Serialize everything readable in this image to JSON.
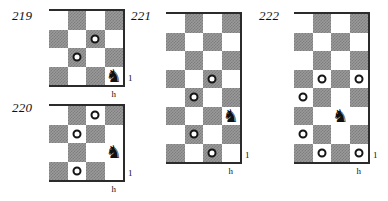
{
  "page": {
    "background_color": "#ffffff",
    "dark_square_color": "#9a9a9a",
    "light_square_color": "#ffffff",
    "ink_color": "#151515"
  },
  "diagrams": [
    {
      "id": "diagram-219",
      "number": "219",
      "columns": 4,
      "rows": 4,
      "top_left_square": "light",
      "rank_label": "1",
      "file_label": "h",
      "pieces": [
        {
          "type": "knight",
          "glyph": "♞",
          "col": 4,
          "row": 4
        }
      ],
      "markers": [
        {
          "type": "ring",
          "col": 3,
          "row": 2
        },
        {
          "type": "ring",
          "col": 2,
          "row": 3
        }
      ]
    },
    {
      "id": "diagram-220",
      "number": "220",
      "columns": 4,
      "rows": 4,
      "top_left_square": "light",
      "rank_label": "1",
      "file_label": "h",
      "pieces": [
        {
          "type": "knight",
          "glyph": "♞",
          "col": 4,
          "row": 3
        }
      ],
      "markers": [
        {
          "type": "ring",
          "col": 3,
          "row": 1
        },
        {
          "type": "ring",
          "col": 2,
          "row": 2
        },
        {
          "type": "ring",
          "col": 2,
          "row": 4
        }
      ]
    },
    {
      "id": "diagram-221",
      "number": "221",
      "columns": 4,
      "rows": 8,
      "top_left_square": "light",
      "rank_label": "1",
      "file_label": "h",
      "pieces": [
        {
          "type": "knight",
          "glyph": "♞",
          "col": 4,
          "row": 6
        }
      ],
      "markers": [
        {
          "type": "ring",
          "col": 3,
          "row": 4
        },
        {
          "type": "ring",
          "col": 2,
          "row": 5
        },
        {
          "type": "ring",
          "col": 2,
          "row": 7
        },
        {
          "type": "ring",
          "col": 3,
          "row": 8
        }
      ]
    },
    {
      "id": "diagram-222",
      "number": "222",
      "columns": 4,
      "rows": 8,
      "top_left_square": "light",
      "rank_label": "1",
      "file_label": "h",
      "pieces": [
        {
          "type": "knight",
          "glyph": "♞",
          "col": 3,
          "row": 6
        }
      ],
      "markers": [
        {
          "type": "ring",
          "col": 2,
          "row": 4
        },
        {
          "type": "ring",
          "col": 4,
          "row": 4
        },
        {
          "type": "ring",
          "col": 1,
          "row": 5
        },
        {
          "type": "ring",
          "col": 1,
          "row": 7
        },
        {
          "type": "ring",
          "col": 2,
          "row": 8
        },
        {
          "type": "ring",
          "col": 4,
          "row": 8
        }
      ]
    }
  ],
  "layout": {
    "diagram_positions": [
      {
        "id": "diagram-219",
        "num_x": 12,
        "num_y": 8,
        "board_x": 49,
        "board_y": 11,
        "cell": 18.5
      },
      {
        "id": "diagram-220",
        "num_x": 12,
        "num_y": 100,
        "board_x": 49,
        "board_y": 106,
        "cell": 18.5
      },
      {
        "id": "diagram-221",
        "num_x": 131,
        "num_y": 8,
        "board_x": 166,
        "board_y": 14,
        "cell": 18.5
      },
      {
        "id": "diagram-222",
        "num_x": 259,
        "num_y": 8,
        "board_x": 294,
        "board_y": 14,
        "cell": 18.5
      }
    ]
  }
}
